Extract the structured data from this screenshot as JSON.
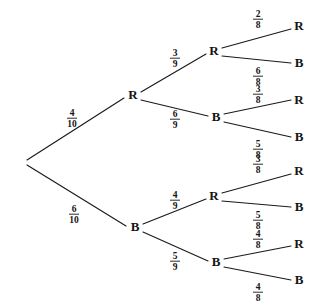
{
  "diagram": {
    "type": "probability-tree",
    "root": {
      "label": "",
      "x": 25,
      "y": 162
    },
    "colors": {
      "line": "#1a1a1a",
      "text": "#141414",
      "background": "#ffffff"
    },
    "nodes": [
      {
        "id": "n-r",
        "label": "R",
        "level": 1,
        "x": 133,
        "y": 96
      },
      {
        "id": "n-b",
        "label": "B",
        "level": 1,
        "x": 135,
        "y": 228
      },
      {
        "id": "n-rr",
        "label": "R",
        "level": 2,
        "x": 214,
        "y": 52
      },
      {
        "id": "n-rb",
        "label": "B",
        "level": 2,
        "x": 216,
        "y": 118
      },
      {
        "id": "n-br",
        "label": "R",
        "level": 2,
        "x": 214,
        "y": 197
      },
      {
        "id": "n-bb",
        "label": "B",
        "level": 2,
        "x": 216,
        "y": 263
      },
      {
        "id": "n-rrr",
        "label": "R",
        "level": 3,
        "x": 299,
        "y": 27
      },
      {
        "id": "n-rrb",
        "label": "B",
        "level": 3,
        "x": 299,
        "y": 64
      },
      {
        "id": "n-rbr",
        "label": "R",
        "level": 3,
        "x": 299,
        "y": 101
      },
      {
        "id": "n-rbb",
        "label": "B",
        "level": 3,
        "x": 299,
        "y": 138
      },
      {
        "id": "n-brr",
        "label": "R",
        "level": 3,
        "x": 299,
        "y": 172
      },
      {
        "id": "n-brb",
        "label": "B",
        "level": 3,
        "x": 299,
        "y": 208
      },
      {
        "id": "n-bbr",
        "label": "R",
        "level": 3,
        "x": 299,
        "y": 245
      },
      {
        "id": "n-bbb",
        "label": "B",
        "level": 3,
        "x": 299,
        "y": 281
      }
    ],
    "branches": [
      {
        "id": "e-root-r",
        "from": "root",
        "to": "n-r",
        "x1": 27,
        "y1": 160,
        "x2": 124,
        "y2": 98,
        "numerator": "4",
        "denominator": "10",
        "label_x": 72,
        "label_y": 117
      },
      {
        "id": "e-root-b",
        "from": "root",
        "to": "n-b",
        "x1": 27,
        "y1": 165,
        "x2": 126,
        "y2": 226,
        "numerator": "6",
        "denominator": "10",
        "label_x": 74,
        "label_y": 213
      },
      {
        "id": "e-r-rr",
        "from": "n-r",
        "to": "n-rr",
        "x1": 141,
        "y1": 92,
        "x2": 206,
        "y2": 54,
        "numerator": "3",
        "denominator": "9",
        "label_x": 175,
        "label_y": 57
      },
      {
        "id": "e-r-rb",
        "from": "n-r",
        "to": "n-rb",
        "x1": 141,
        "y1": 100,
        "x2": 208,
        "y2": 116,
        "numerator": "6",
        "denominator": "9",
        "label_x": 175,
        "label_y": 118
      },
      {
        "id": "e-b-br",
        "from": "n-b",
        "to": "n-br",
        "x1": 143,
        "y1": 224,
        "x2": 206,
        "y2": 199,
        "numerator": "4",
        "denominator": "9",
        "label_x": 175,
        "label_y": 199
      },
      {
        "id": "e-b-bb",
        "from": "n-b",
        "to": "n-bb",
        "x1": 143,
        "y1": 232,
        "x2": 208,
        "y2": 261,
        "numerator": "5",
        "denominator": "9",
        "label_x": 175,
        "label_y": 260
      },
      {
        "id": "e-rr-rrr",
        "from": "n-rr",
        "to": "n-rrr",
        "x1": 222,
        "y1": 48,
        "x2": 291,
        "y2": 29,
        "numerator": "2",
        "denominator": "8",
        "label_x": 258,
        "label_y": 18
      },
      {
        "id": "e-rr-rrb",
        "from": "n-rr",
        "to": "n-rrb",
        "x1": 222,
        "y1": 56,
        "x2": 291,
        "y2": 63,
        "numerator": "6",
        "denominator": "8",
        "label_x": 258,
        "label_y": 75
      },
      {
        "id": "e-rb-rbr",
        "from": "n-rb",
        "to": "n-rbr",
        "x1": 224,
        "y1": 114,
        "x2": 291,
        "y2": 100,
        "numerator": "3",
        "denominator": "8",
        "label_x": 258,
        "label_y": 93
      },
      {
        "id": "e-rb-rbb",
        "from": "n-rb",
        "to": "n-rbb",
        "x1": 224,
        "y1": 122,
        "x2": 291,
        "y2": 137,
        "numerator": "5",
        "denominator": "8",
        "label_x": 258,
        "label_y": 148
      },
      {
        "id": "e-br-brr",
        "from": "n-br",
        "to": "n-brr",
        "x1": 222,
        "y1": 193,
        "x2": 291,
        "y2": 174,
        "numerator": "3",
        "denominator": "8",
        "label_x": 258,
        "label_y": 163
      },
      {
        "id": "e-br-brb",
        "from": "n-br",
        "to": "n-brb",
        "x1": 222,
        "y1": 201,
        "x2": 291,
        "y2": 207,
        "numerator": "5",
        "denominator": "8",
        "label_x": 258,
        "label_y": 219
      },
      {
        "id": "e-bb-bbr",
        "from": "n-bb",
        "to": "n-bbr",
        "x1": 224,
        "y1": 259,
        "x2": 291,
        "y2": 246,
        "numerator": "4",
        "denominator": "8",
        "label_x": 258,
        "label_y": 238
      },
      {
        "id": "e-bb-bbb",
        "from": "n-bb",
        "to": "n-bbb",
        "x1": 224,
        "y1": 267,
        "x2": 291,
        "y2": 280,
        "numerator": "4",
        "denominator": "8",
        "label_x": 258,
        "label_y": 291
      }
    ]
  },
  "chart_data": {
    "type": "tree",
    "levels": 3,
    "outcome_labels": [
      "R",
      "B"
    ],
    "branch_probabilities": {
      "level_1": [
        {
          "outcome": "R",
          "fraction": "4/10",
          "numerator": 4,
          "denominator": 10
        },
        {
          "outcome": "B",
          "fraction": "6/10",
          "numerator": 6,
          "denominator": 10
        }
      ],
      "level_2": [
        {
          "parent": "R",
          "outcome": "R",
          "fraction": "3/9",
          "numerator": 3,
          "denominator": 9
        },
        {
          "parent": "R",
          "outcome": "B",
          "fraction": "6/9",
          "numerator": 6,
          "denominator": 9
        },
        {
          "parent": "B",
          "outcome": "R",
          "fraction": "4/9",
          "numerator": 4,
          "denominator": 9
        },
        {
          "parent": "B",
          "outcome": "B",
          "fraction": "5/9",
          "numerator": 5,
          "denominator": 9
        }
      ],
      "level_3": [
        {
          "parent": "RR",
          "outcome": "R",
          "fraction": "2/8",
          "numerator": 2,
          "denominator": 8
        },
        {
          "parent": "RR",
          "outcome": "B",
          "fraction": "6/8",
          "numerator": 6,
          "denominator": 8
        },
        {
          "parent": "RB",
          "outcome": "R",
          "fraction": "3/8",
          "numerator": 3,
          "denominator": 8
        },
        {
          "parent": "RB",
          "outcome": "B",
          "fraction": "5/8",
          "numerator": 5,
          "denominator": 8
        },
        {
          "parent": "BR",
          "outcome": "R",
          "fraction": "3/8",
          "numerator": 3,
          "denominator": 8
        },
        {
          "parent": "BR",
          "outcome": "B",
          "fraction": "5/8",
          "numerator": 5,
          "denominator": 8
        },
        {
          "parent": "BB",
          "outcome": "R",
          "fraction": "4/8",
          "numerator": 4,
          "denominator": 8
        },
        {
          "parent": "BB",
          "outcome": "B",
          "fraction": "4/8",
          "numerator": 4,
          "denominator": 8
        }
      ]
    },
    "leaf_outcomes": [
      "RRR",
      "RRB",
      "RBR",
      "RBB",
      "BRR",
      "BRB",
      "BBR",
      "BBB"
    ]
  }
}
